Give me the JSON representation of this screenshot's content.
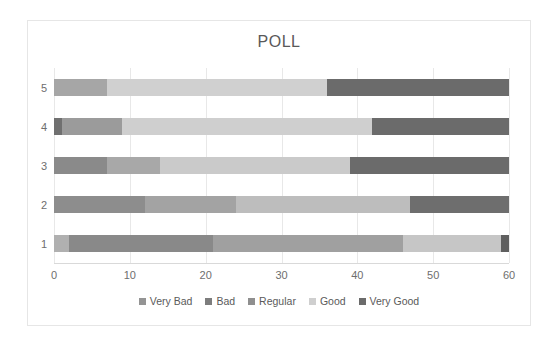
{
  "chart_data": {
    "type": "bar",
    "orientation": "horizontal",
    "stacked": true,
    "title": "POLL",
    "xlabel": "",
    "ylabel": "",
    "xlim": [
      0,
      60
    ],
    "xticks": [
      0,
      10,
      20,
      30,
      40,
      50,
      60
    ],
    "categories": [
      "1",
      "2",
      "3",
      "4",
      "5"
    ],
    "category_order_top_to_bottom": [
      "5",
      "4",
      "3",
      "2",
      "1"
    ],
    "grid": true,
    "legend_position": "bottom",
    "series": [
      {
        "name": "Very Bad",
        "color": "#a6a6a6",
        "values": [
          2,
          12,
          7,
          1,
          7
        ]
      },
      {
        "name": "Bad",
        "color": "#808080",
        "values": [
          19,
          12,
          7,
          8,
          0
        ]
      },
      {
        "name": "Regular",
        "color": "#949494",
        "values": [
          25,
          23,
          25,
          0,
          0
        ]
      },
      {
        "name": "Good",
        "color": "#d0d0d0",
        "values": [
          13,
          0,
          0,
          33,
          29
        ]
      },
      {
        "name": "Very Good",
        "color": "#6b6b6b",
        "values": [
          1,
          13,
          21,
          18,
          24
        ]
      }
    ],
    "bars_top_to_bottom": [
      {
        "category": "5",
        "segments": [
          {
            "label": "Very Bad",
            "value": 7,
            "start": 0,
            "end": 7,
            "color": "#a6a6a6"
          },
          {
            "label": "Good",
            "value": 29,
            "start": 7,
            "end": 36,
            "color": "#d0d0d0"
          },
          {
            "label": "Very Good",
            "value": 24,
            "start": 36,
            "end": 60,
            "color": "#6b6b6b"
          }
        ]
      },
      {
        "category": "4",
        "segments": [
          {
            "label": "Very Bad",
            "value": 1,
            "start": 0,
            "end": 1,
            "color": "#707070"
          },
          {
            "label": "Bad",
            "value": 8,
            "start": 1,
            "end": 9,
            "color": "#9b9b9b"
          },
          {
            "label": "Good",
            "value": 33,
            "start": 9,
            "end": 42,
            "color": "#cfcfcf"
          },
          {
            "label": "Very Good",
            "value": 18,
            "start": 42,
            "end": 60,
            "color": "#6b6b6b"
          }
        ]
      },
      {
        "category": "3",
        "segments": [
          {
            "label": "Very Bad",
            "value": 7,
            "start": 0,
            "end": 7,
            "color": "#8a8a8a"
          },
          {
            "label": "Bad",
            "value": 7,
            "start": 7,
            "end": 14,
            "color": "#a8a8a8"
          },
          {
            "label": "Regular",
            "value": 25,
            "start": 14,
            "end": 39,
            "color": "#cacaca"
          },
          {
            "label": "Very Good",
            "value": 21,
            "start": 39,
            "end": 60,
            "color": "#6b6b6b"
          }
        ]
      },
      {
        "category": "2",
        "segments": [
          {
            "label": "Very Bad",
            "value": 12,
            "start": 0,
            "end": 12,
            "color": "#8d8d8d"
          },
          {
            "label": "Bad",
            "value": 12,
            "start": 12,
            "end": 24,
            "color": "#a3a3a3"
          },
          {
            "label": "Regular",
            "value": 23,
            "start": 24,
            "end": 47,
            "color": "#bdbdbd"
          },
          {
            "label": "Very Good",
            "value": 13,
            "start": 47,
            "end": 60,
            "color": "#6e6e6e"
          }
        ]
      },
      {
        "category": "1",
        "segments": [
          {
            "label": "Very Bad",
            "value": 2,
            "start": 0,
            "end": 2,
            "color": "#b0b0b0"
          },
          {
            "label": "Bad",
            "value": 19,
            "start": 2,
            "end": 21,
            "color": "#898989"
          },
          {
            "label": "Regular",
            "value": 25,
            "start": 21,
            "end": 46,
            "color": "#a0a0a0"
          },
          {
            "label": "Good",
            "value": 13,
            "start": 46,
            "end": 59,
            "color": "#c6c6c6"
          },
          {
            "label": "Very Good",
            "value": 1,
            "start": 59,
            "end": 60,
            "color": "#5f5f5f"
          }
        ]
      }
    ],
    "legend": [
      {
        "label": "Very Bad",
        "color": "#949494"
      },
      {
        "label": "Bad",
        "color": "#7d7d7d"
      },
      {
        "label": "Regular",
        "color": "#8f8f8f"
      },
      {
        "label": "Good",
        "color": "#cfcfcf"
      },
      {
        "label": "Very Good",
        "color": "#6b6b6b"
      }
    ]
  }
}
